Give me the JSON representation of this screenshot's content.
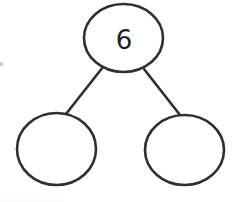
{
  "diagram": {
    "type": "number-bond",
    "whole": {
      "label": "6",
      "value": 6
    },
    "parts": [
      {
        "label": "",
        "value": null
      },
      {
        "label": "",
        "value": null
      }
    ],
    "colors": {
      "stroke": "#2f2f2f",
      "text": "#1e1e1e",
      "background": "#ffffff"
    }
  }
}
